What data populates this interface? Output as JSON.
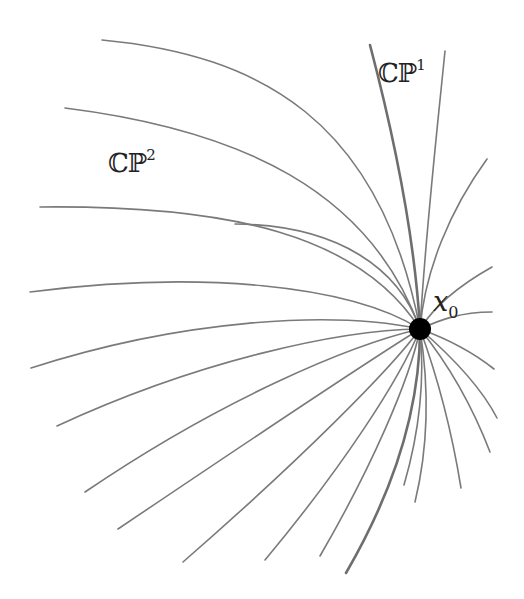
{
  "diagram": {
    "point": {
      "label_main": "x",
      "label_sub": "0",
      "cx": 420,
      "cy": 329,
      "r": 11,
      "color": "#000000"
    },
    "labels": [
      {
        "id": "cp1",
        "main": "ℂℙ",
        "sup": "1"
      },
      {
        "id": "cp2",
        "main": "ℂℙ",
        "sup": "2"
      }
    ],
    "line_color": "#7a7a7a",
    "curves": [
      {
        "d": "M102,40 C260,55 380,120 420,329",
        "bold": false
      },
      {
        "d": "M65,108 C240,130 370,190 420,329",
        "bold": false
      },
      {
        "d": "M40,207 C230,205 360,235 420,329",
        "bold": false
      },
      {
        "d": "M30,292 C200,270 350,285 420,329",
        "bold": false
      },
      {
        "d": "M31,368 C180,320 330,310 420,329",
        "bold": false
      },
      {
        "d": "M57,426 C200,360 340,330 420,329",
        "bold": false
      },
      {
        "d": "M85,492 C220,400 350,345 420,329",
        "bold": false
      },
      {
        "d": "M118,529 C250,440 370,360 420,329",
        "bold": false
      },
      {
        "d": "M183,562 C300,460 390,370 420,329",
        "bold": false
      },
      {
        "d": "M265,560 C340,470 400,380 420,329",
        "bold": false
      },
      {
        "d": "M320,556 C370,470 410,380 420,329",
        "bold": false
      },
      {
        "d": "M346,573 C400,480 420,400 420,329",
        "bold": true
      },
      {
        "d": "M404,485 C420,430 425,380 420,329",
        "bold": false
      },
      {
        "d": "M415,502 C430,440 428,380 420,329",
        "bold": false
      },
      {
        "d": "M461,488 C450,420 435,370 420,329",
        "bold": false
      },
      {
        "d": "M490,452 C470,400 445,360 420,329",
        "bold": false
      },
      {
        "d": "M497,418 C480,385 450,355 420,329",
        "bold": false
      },
      {
        "d": "M494,369 C470,350 445,338 420,329",
        "bold": false
      },
      {
        "d": "M492,312 C460,312 440,320 420,329",
        "bold": false
      },
      {
        "d": "M492,267 C460,285 435,305 420,329",
        "bold": false
      },
      {
        "d": "M487,159 C450,210 425,270 420,329",
        "bold": false
      },
      {
        "d": "M445,51 C435,150 425,240 420,329",
        "bold": false
      },
      {
        "d": "M370,45 C395,140 415,240 420,329",
        "bold": true
      },
      {
        "d": "M235,224 C340,225 400,270 420,329",
        "bold": false
      }
    ]
  }
}
